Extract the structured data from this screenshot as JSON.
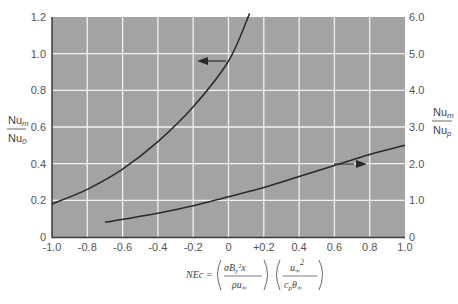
{
  "chart_data": {
    "type": "line",
    "title": "",
    "xlabel": "NEc = (σ B_y² x / ρ u∞) (u∞² / c_p θ∞)",
    "ylabel_left": "Nu_m / Nu_0",
    "ylabel_right": "Nu_m / Nu_p",
    "xlim": [
      -1.0,
      1.0
    ],
    "ylim_left": [
      0,
      1.2
    ],
    "ylim_right": [
      0,
      6.0
    ],
    "grid": true,
    "x_ticks": [
      "-1.0",
      "-0.8",
      "-0.6",
      "-0.4",
      "-0.2",
      "0",
      "+0.2",
      "0.4",
      "0.6",
      "0.8",
      "1.0"
    ],
    "y_ticks_left": [
      "0",
      "0.2",
      "0.4",
      "0.6",
      "0.8",
      "1.0",
      "1.2"
    ],
    "y_ticks_right": [
      "0",
      "1.0",
      "2.0",
      "3.0",
      "4.0",
      "5.0",
      "6.0"
    ],
    "series": [
      {
        "name": "left-axis curve (arrow points left)",
        "axis": "left",
        "x": [
          -1.0,
          -0.8,
          -0.6,
          -0.4,
          -0.2,
          0.0,
          0.12
        ],
        "y": [
          0.18,
          0.26,
          0.37,
          0.52,
          0.71,
          0.96,
          1.22
        ]
      },
      {
        "name": "right-axis curve (arrow points right)",
        "axis": "right",
        "x": [
          -0.7,
          -0.4,
          -0.2,
          0.0,
          0.2,
          0.4,
          0.6,
          0.8,
          1.0
        ],
        "y": [
          0.4,
          0.65,
          0.85,
          1.1,
          1.35,
          1.65,
          1.95,
          2.25,
          2.5
        ]
      }
    ],
    "annotations": [
      {
        "type": "arrow",
        "direction": "left",
        "near_x": -0.1,
        "near_y_left": 0.95,
        "series": 0
      },
      {
        "type": "arrow",
        "direction": "right",
        "near_x": 0.6,
        "near_y_right": 2.1,
        "series": 1
      }
    ]
  },
  "labels": {
    "left_num": "Nu",
    "left_num_sub": "m",
    "left_den": "Nu",
    "left_den_sub": "0",
    "right_num": "Nu",
    "right_num_sub": "m",
    "right_den": "Nu",
    "right_den_sub": "p",
    "formula_lhs": "NEc =",
    "formula_f1_num": "σB",
    "formula_f1_num_sub": "y",
    "formula_f1_num_rest": "²x",
    "formula_f1_den": "ρu",
    "formula_f1_den_sub": "∞",
    "formula_f2_num": "u",
    "formula_f2_num_sub": "∞",
    "formula_f2_num_sup": "2",
    "formula_f2_den": "c",
    "formula_f2_den_sub": "p",
    "formula_f2_den_rest": "θ",
    "formula_f2_den_rest_sub": "∞"
  },
  "colors": {
    "plot_bg": "#a3a3a3",
    "grid": "#f2f2f2",
    "curve": "#2a2a2a",
    "axis": "#3a3a3a"
  }
}
